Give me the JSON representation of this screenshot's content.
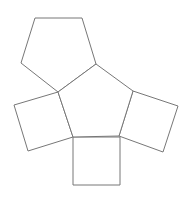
{
  "figure": {
    "stroke_color": "#777777",
    "fill_color": "#ffffff",
    "stroke_width": 1
  },
  "shapes": {
    "center_pentagon": {
      "name": "central pentagon",
      "points": "96,64 133,91 119,136 73,137 58,92"
    },
    "top_pentagon": {
      "name": "top pentagon",
      "points": "35,18 82,18 96,64 58,92 21,63"
    },
    "right_square": {
      "name": "right square",
      "points": "133,91 178,106 163,152 119,136"
    },
    "left_square": {
      "name": "left square",
      "points": "58,92 14,105 28,151 73,137"
    },
    "bottom_square": {
      "name": "bottom square",
      "points": "73,137 120,137 120,185 73,185"
    }
  }
}
